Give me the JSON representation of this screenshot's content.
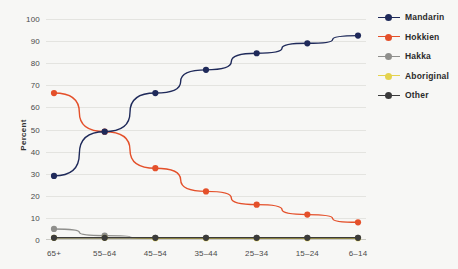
{
  "chart_data": {
    "type": "line",
    "title": "",
    "xlabel": "",
    "ylabel": "Percent",
    "categories": [
      "65+",
      "55–64",
      "45–54",
      "35–44",
      "25–34",
      "15–24",
      "6–14"
    ],
    "ylim": [
      0,
      100
    ],
    "yticks": [
      0,
      10,
      20,
      30,
      40,
      50,
      60,
      70,
      80,
      90,
      100
    ],
    "grid": true,
    "legend_position": "right",
    "series": [
      {
        "name": "Mandarin",
        "color": "#1f2a5a",
        "values": [
          29,
          49,
          66.5,
          77,
          84.5,
          89,
          92.5
        ]
      },
      {
        "name": "Hokkien",
        "color": "#e4502a",
        "values": [
          66.5,
          49,
          32.5,
          22,
          16,
          11.5,
          8
        ]
      },
      {
        "name": "Hakka",
        "color": "#8f8f8c",
        "values": [
          5,
          2,
          1,
          1,
          1,
          1,
          1
        ]
      },
      {
        "name": "Aboriginal",
        "color": "#e4d24d",
        "values": [
          1,
          1,
          0.8,
          0.8,
          0.8,
          0.8,
          0.8
        ]
      },
      {
        "name": "Other",
        "color": "#3b3b3b",
        "values": [
          1,
          1,
          1,
          1,
          1,
          1,
          1
        ]
      }
    ]
  },
  "legend": {
    "items": [
      {
        "label": "Mandarin"
      },
      {
        "label": "Hokkien"
      },
      {
        "label": "Hakka"
      },
      {
        "label": "Aboriginal"
      },
      {
        "label": "Other"
      }
    ]
  }
}
